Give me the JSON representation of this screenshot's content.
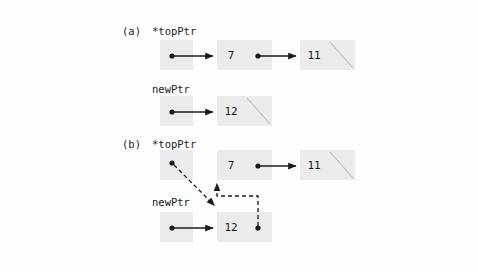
{
  "diagram": {
    "colors": {
      "background": "#fdfdfd",
      "node_fill": "#ebebeb",
      "stroke": "#1b1b1b",
      "dashed_stroke": "#4d4d4d"
    },
    "sections": [
      {
        "id": "a",
        "label": "(a)",
        "pointers": [
          {
            "name": "topPtr",
            "label": "*topPtr"
          },
          {
            "name": "newPtr",
            "label": "newPtr"
          }
        ],
        "nodes": [
          {
            "value": "7",
            "next": "node-11"
          },
          {
            "value": "11",
            "next": "null"
          },
          {
            "value": "12",
            "next": "null"
          }
        ]
      },
      {
        "id": "b",
        "label": "(b)",
        "pointers": [
          {
            "name": "topPtr",
            "label": "*topPtr"
          },
          {
            "name": "newPtr",
            "label": "newPtr"
          }
        ],
        "nodes": [
          {
            "value": "7",
            "next": "node-11"
          },
          {
            "value": "11",
            "next": "null"
          },
          {
            "value": "12",
            "next": "node-7"
          }
        ]
      }
    ],
    "values": {
      "seven": "7",
      "eleven": "11",
      "twelve": "12"
    },
    "labels": {
      "section_a": "(a)",
      "section_b": "(b)",
      "top_ptr": "*topPtr",
      "new_ptr": "newPtr"
    }
  }
}
